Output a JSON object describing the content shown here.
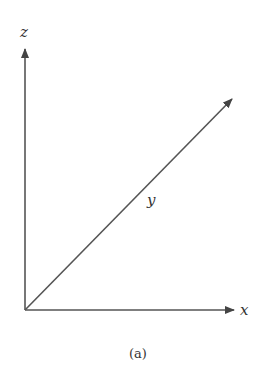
{
  "diagram": {
    "type": "3d-coordinate-axes",
    "axes": [
      {
        "name": "z",
        "label": "z",
        "direction": "up"
      },
      {
        "name": "x",
        "label": "x",
        "direction": "right"
      },
      {
        "name": "y",
        "label": "y",
        "direction": "diagonal-up-right"
      }
    ],
    "caption": "(a)",
    "line_color": "#444444"
  }
}
